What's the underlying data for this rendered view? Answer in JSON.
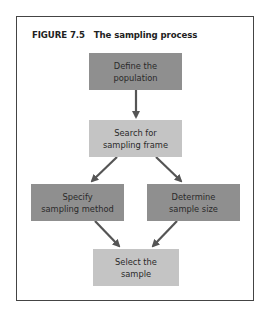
{
  "figure": {
    "label": "FIGURE 7.5",
    "title": "The sampling process"
  },
  "nodes": [
    {
      "id": "define",
      "line1": "Define the",
      "line2": "population",
      "shade": "dark"
    },
    {
      "id": "search",
      "line1": "Search for",
      "line2": "sampling frame",
      "shade": "light"
    },
    {
      "id": "specify",
      "line1": "Specify",
      "line2": "sampling method",
      "shade": "dark"
    },
    {
      "id": "determine",
      "line1": "Determine",
      "line2": "sample size",
      "shade": "dark"
    },
    {
      "id": "select",
      "line1": "Select the",
      "line2": "sample",
      "shade": "light"
    }
  ],
  "edges": [
    {
      "from": "define",
      "to": "search"
    },
    {
      "from": "search",
      "to": "specify"
    },
    {
      "from": "search",
      "to": "determine"
    },
    {
      "from": "specify",
      "to": "select"
    },
    {
      "from": "determine",
      "to": "select"
    }
  ],
  "colors": {
    "dark_box": "#8f8f8f",
    "light_box": "#c4c4c4",
    "arrow": "#555555",
    "frame": "#444444"
  }
}
